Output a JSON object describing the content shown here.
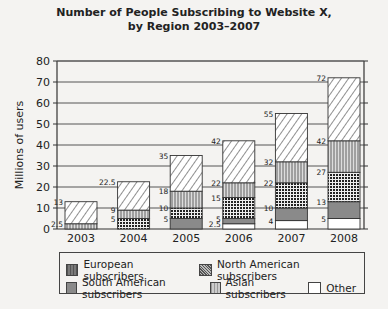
{
  "chart_title_line1": "Number of People Subscribing to Website X,",
  "chart_title_line2": "by Region 2003–2007",
  "chart_data": {
    "type": "bar",
    "stacked": true,
    "title": "Number of People Subscribing to Website X, by Region 2003–2007",
    "xlabel": "",
    "ylabel": "Millions of users",
    "ylim": [
      0,
      80
    ],
    "yticks": [
      0,
      10,
      20,
      30,
      40,
      50,
      60,
      70,
      80
    ],
    "grid": true,
    "legend_position": "bottom",
    "categories": [
      "2003",
      "2004",
      "2005",
      "2006",
      "2007",
      "2008"
    ],
    "cumulative_labels": [
      {
        "year": "2003",
        "labels": [
          "2.5",
          "13"
        ]
      },
      {
        "year": "2004",
        "labels": [
          "5",
          "9",
          "22.5"
        ]
      },
      {
        "year": "2005",
        "labels": [
          "5",
          "10",
          "18",
          "35"
        ]
      },
      {
        "year": "2006",
        "labels": [
          "2.5",
          "5",
          "15",
          "22",
          "42"
        ]
      },
      {
        "year": "2007",
        "labels": [
          "4",
          "10",
          "22",
          "32",
          "55"
        ]
      },
      {
        "year": "2008",
        "labels": [
          "5",
          "13",
          "27",
          "42",
          "72"
        ]
      }
    ],
    "series": [
      {
        "name": "Other",
        "values": [
          0,
          0,
          0,
          2.5,
          4,
          5
        ]
      },
      {
        "name": "South American subscribers",
        "values": [
          0,
          0,
          5,
          2.5,
          6,
          8
        ]
      },
      {
        "name": "Asian subscribers",
        "values": [
          0,
          5,
          5,
          10,
          12,
          14
        ]
      },
      {
        "name": "European subscribers",
        "values": [
          2.5,
          4,
          8,
          7,
          10,
          15
        ]
      },
      {
        "name": "North American subscribers",
        "values": [
          10.5,
          13.5,
          17,
          20,
          23,
          30
        ]
      }
    ]
  },
  "legend": {
    "european": "European subscribers",
    "north_american": "North American subscribers",
    "south_american": "South American subscribers",
    "asian": "Asian subscribers",
    "other": "Other"
  }
}
